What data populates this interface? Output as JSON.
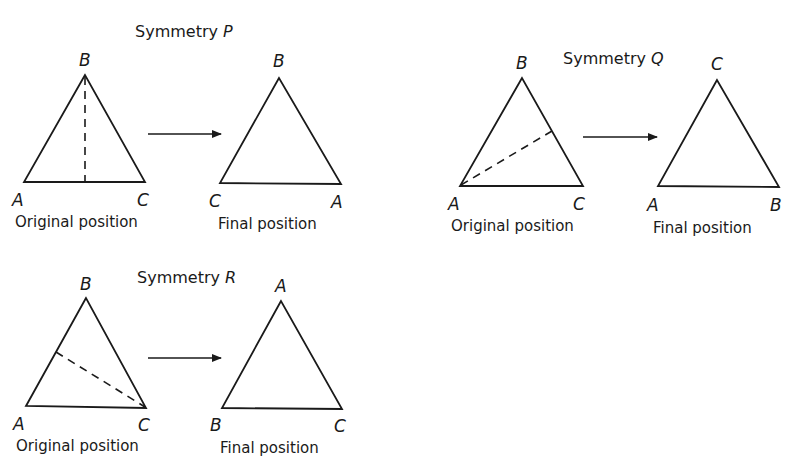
{
  "figure": {
    "panels": [
      {
        "id": "P",
        "title_prefix": "Symmetry ",
        "title_var": "P",
        "axis_description": "vertical line from B to midpoint of AC",
        "original": {
          "caption": "Original position",
          "top": "B",
          "bottom_left": "A",
          "bottom_right": "C"
        },
        "final": {
          "caption": "Final position",
          "top": "B",
          "bottom_left": "C",
          "bottom_right": "A"
        }
      },
      {
        "id": "Q",
        "title_prefix": "Symmetry ",
        "title_var": "Q",
        "axis_description": "line from A to midpoint of BC",
        "original": {
          "caption": "Original position",
          "top": "B",
          "bottom_left": "A",
          "bottom_right": "C"
        },
        "final": {
          "caption": "Final position",
          "top": "C",
          "bottom_left": "A",
          "bottom_right": "B"
        }
      },
      {
        "id": "R",
        "title_prefix": "Symmetry ",
        "title_var": "R",
        "axis_description": "line from C to midpoint of AB",
        "original": {
          "caption": "Original position",
          "top": "B",
          "bottom_left": "A",
          "bottom_right": "C"
        },
        "final": {
          "caption": "Final position",
          "top": "A",
          "bottom_left": "B",
          "bottom_right": "C"
        }
      }
    ],
    "colors": {
      "ink": "#1a1a1a",
      "background": "#ffffff"
    }
  }
}
